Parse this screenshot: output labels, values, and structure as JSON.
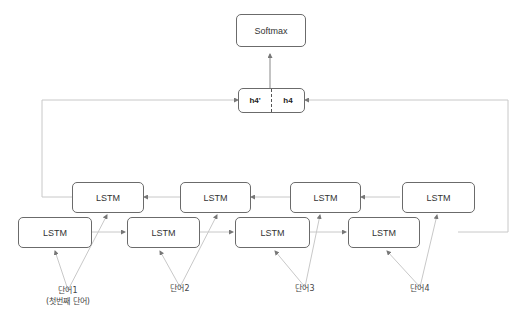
{
  "diagram": {
    "output_node": {
      "label": "Softmax"
    },
    "hidden_concat": {
      "left_label": "h4'",
      "right_label": "h4"
    },
    "backward_row": [
      {
        "label": "LSTM"
      },
      {
        "label": "LSTM"
      },
      {
        "label": "LSTM"
      },
      {
        "label": "LSTM"
      }
    ],
    "forward_row": [
      {
        "label": "LSTM"
      },
      {
        "label": "LSTM"
      },
      {
        "label": "LSTM"
      },
      {
        "label": "LSTM"
      }
    ],
    "inputs": [
      {
        "label": "단어1",
        "sublabel": "(첫번째 단어)"
      },
      {
        "label": "단어2"
      },
      {
        "label": "단어3"
      },
      {
        "label": "단어4"
      }
    ],
    "colors": {
      "box_border": "#6b6b6b",
      "wire": "#c8c8c8",
      "text": "#333333"
    }
  }
}
